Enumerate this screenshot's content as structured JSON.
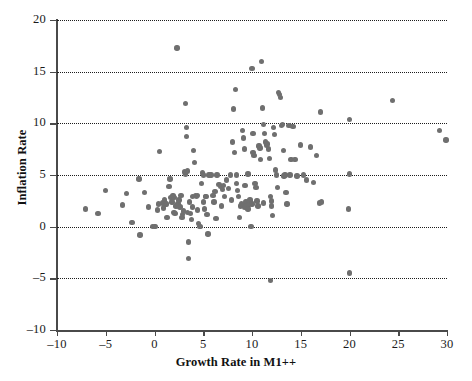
{
  "chart_data": {
    "type": "scatter",
    "title": "",
    "xlabel": "Growth Rate in M1++",
    "ylabel": "Inflation Rate",
    "xlim": [
      -10,
      30
    ],
    "ylim": [
      -10,
      20
    ],
    "xticks": [
      -10,
      -5,
      0,
      5,
      10,
      15,
      20,
      25,
      30
    ],
    "xticklabels": [
      "–10",
      "–5",
      "0",
      "5",
      "10",
      "15",
      "20",
      "25",
      "30"
    ],
    "yticks": [
      -10,
      -5,
      0,
      5,
      10,
      15,
      20
    ],
    "yticklabels": [
      "–10",
      "–5",
      "0",
      "5",
      "10",
      "15",
      "20"
    ],
    "grid": "horizontal-dotted",
    "gridlines_y": [
      20,
      15,
      10,
      5,
      0,
      -5
    ],
    "legend": null,
    "marker": {
      "shape": "circle",
      "color": "#6f6f6f",
      "size": 5
    },
    "series": [
      {
        "name": "observations",
        "points": [
          [
            -7.1,
            1.7
          ],
          [
            -5.8,
            1.3
          ],
          [
            -5.0,
            3.5
          ],
          [
            -3.3,
            2.1
          ],
          [
            -2.9,
            3.2
          ],
          [
            -2.3,
            0.4
          ],
          [
            -1.6,
            4.6
          ],
          [
            -1.5,
            -0.8
          ],
          [
            -1.0,
            3.3
          ],
          [
            -0.6,
            1.9
          ],
          [
            -0.2,
            0.0
          ],
          [
            0.0,
            0.0
          ],
          [
            0.1,
            0.0
          ],
          [
            0.3,
            1.6
          ],
          [
            0.4,
            2.2
          ],
          [
            0.5,
            7.3
          ],
          [
            0.8,
            2.3
          ],
          [
            1.0,
            2.6
          ],
          [
            1.1,
            2.2
          ],
          [
            1.3,
            0.9
          ],
          [
            1.5,
            3.9
          ],
          [
            1.6,
            4.6
          ],
          [
            1.7,
            2.8
          ],
          [
            1.8,
            2.4
          ],
          [
            1.9,
            3.0
          ],
          [
            2.0,
            1.4
          ],
          [
            2.1,
            1.3
          ],
          [
            2.3,
            17.3
          ],
          [
            2.4,
            2.2
          ],
          [
            2.5,
            2.6
          ],
          [
            2.6,
            1.9
          ],
          [
            2.7,
            3.0
          ],
          [
            2.8,
            0.9
          ],
          [
            2.9,
            1.2
          ],
          [
            3.0,
            1.5
          ],
          [
            3.1,
            5.3
          ],
          [
            3.2,
            5.1
          ],
          [
            3.2,
            11.9
          ],
          [
            3.3,
            9.6
          ],
          [
            3.3,
            8.7
          ],
          [
            3.4,
            5.4
          ],
          [
            3.4,
            1.4
          ],
          [
            3.5,
            -1.5
          ],
          [
            3.5,
            -3.1
          ],
          [
            3.6,
            2.4
          ],
          [
            3.7,
            1.3
          ],
          [
            3.8,
            0.7
          ],
          [
            3.9,
            2.9
          ],
          [
            4.0,
            7.4
          ],
          [
            4.1,
            6.2
          ],
          [
            4.2,
            3.0
          ],
          [
            4.3,
            2.9
          ],
          [
            4.4,
            1.6
          ],
          [
            4.5,
            0.3
          ],
          [
            4.6,
            0.0
          ],
          [
            4.7,
            0.0
          ],
          [
            4.8,
            4.2
          ],
          [
            4.9,
            5.2
          ],
          [
            5.0,
            5.0
          ],
          [
            5.0,
            2.4
          ],
          [
            5.1,
            1.7
          ],
          [
            5.2,
            2.9
          ],
          [
            5.3,
            2.9
          ],
          [
            5.4,
            1.2
          ],
          [
            5.5,
            -0.7
          ],
          [
            5.8,
            5.0
          ],
          [
            6.0,
            3.0
          ],
          [
            6.1,
            2.4
          ],
          [
            6.3,
            0.8
          ],
          [
            6.4,
            5.0
          ],
          [
            6.6,
            4.1
          ],
          [
            6.8,
            3.9
          ],
          [
            7.0,
            3.6
          ],
          [
            7.2,
            2.9
          ],
          [
            7.4,
            4.5
          ],
          [
            7.6,
            3.7
          ],
          [
            7.8,
            5.0
          ],
          [
            8.0,
            8.2
          ],
          [
            8.1,
            11.4
          ],
          [
            8.2,
            7.2
          ],
          [
            8.3,
            13.3
          ],
          [
            8.4,
            4.2
          ],
          [
            8.5,
            3.5
          ],
          [
            8.6,
            2.9
          ],
          [
            8.7,
            0.9
          ],
          [
            8.8,
            2.0
          ],
          [
            8.9,
            2.2
          ],
          [
            9.0,
            9.3
          ],
          [
            9.1,
            8.6
          ],
          [
            9.2,
            7.5
          ],
          [
            9.3,
            4.0
          ],
          [
            9.4,
            2.4
          ],
          [
            9.5,
            2.0
          ],
          [
            9.6,
            1.7
          ],
          [
            9.7,
            2.2
          ],
          [
            9.8,
            2.6
          ],
          [
            9.9,
            0.0
          ],
          [
            10.0,
            15.3
          ],
          [
            10.1,
            9.0
          ],
          [
            10.1,
            7.2
          ],
          [
            10.2,
            6.9
          ],
          [
            10.3,
            4.2
          ],
          [
            10.4,
            3.8
          ],
          [
            10.5,
            2.5
          ],
          [
            10.6,
            2.0
          ],
          [
            10.7,
            7.8
          ],
          [
            10.8,
            7.6
          ],
          [
            10.9,
            6.5
          ],
          [
            11.0,
            16.0
          ],
          [
            11.1,
            11.5
          ],
          [
            11.2,
            9.9
          ],
          [
            11.3,
            9.0
          ],
          [
            11.4,
            8.2
          ],
          [
            11.5,
            7.9
          ],
          [
            11.6,
            8.0
          ],
          [
            11.7,
            7.5
          ],
          [
            11.8,
            6.6
          ],
          [
            11.9,
            2.9
          ],
          [
            12.0,
            2.5
          ],
          [
            12.1,
            1.1
          ],
          [
            12.2,
            9.6
          ],
          [
            12.3,
            8.9
          ],
          [
            12.4,
            5.5
          ],
          [
            12.5,
            5.0
          ],
          [
            12.6,
            3.8
          ],
          [
            12.7,
            13.0
          ],
          [
            12.8,
            12.8
          ],
          [
            12.9,
            12.5
          ],
          [
            13.0,
            9.8
          ],
          [
            13.1,
            9.9
          ],
          [
            13.2,
            7.4
          ],
          [
            13.3,
            4.9
          ],
          [
            13.4,
            5.0
          ],
          [
            13.5,
            3.3
          ],
          [
            13.6,
            2.2
          ],
          [
            13.8,
            9.8
          ],
          [
            14.0,
            6.5
          ],
          [
            14.2,
            9.7
          ],
          [
            14.4,
            6.5
          ],
          [
            14.6,
            4.9
          ],
          [
            15.0,
            7.9
          ],
          [
            15.3,
            5.0
          ],
          [
            15.6,
            4.5
          ],
          [
            16.0,
            7.7
          ],
          [
            16.3,
            4.3
          ],
          [
            16.6,
            6.9
          ],
          [
            16.9,
            2.3
          ],
          [
            17.0,
            11.1
          ],
          [
            17.1,
            2.4
          ],
          [
            11.9,
            -5.2
          ],
          [
            19.9,
            1.7
          ],
          [
            20.0,
            10.4
          ],
          [
            20.0,
            5.1
          ],
          [
            20.0,
            -4.5
          ],
          [
            24.4,
            12.2
          ],
          [
            29.2,
            9.3
          ],
          [
            29.9,
            8.4
          ],
          [
            2.2,
            2.0
          ],
          [
            3.9,
            1.9
          ],
          [
            4.4,
            3.0
          ],
          [
            6.9,
            2.0
          ],
          [
            7.9,
            2.6
          ],
          [
            9.2,
            1.9
          ],
          [
            10.0,
            2.2
          ],
          [
            11.2,
            2.3
          ],
          [
            12.0,
            2.0
          ],
          [
            5.6,
            5.0
          ],
          [
            8.4,
            5.0
          ],
          [
            9.6,
            5.1
          ],
          [
            2.0,
            2.8
          ],
          [
            1.2,
            2.2
          ],
          [
            0.9,
            1.8
          ],
          [
            6.2,
            3.4
          ],
          [
            7.1,
            4.0
          ],
          [
            13.9,
            5.0
          ]
        ]
      }
    ]
  }
}
